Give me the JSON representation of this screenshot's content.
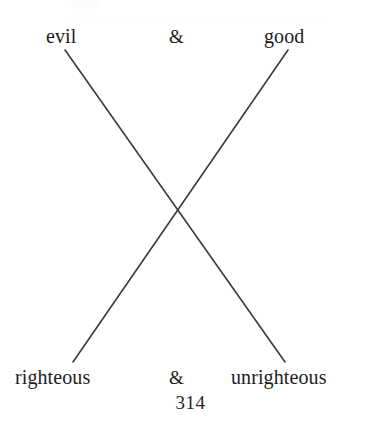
{
  "page": {
    "background_color": "#ffffff",
    "text_color": "#1d1d1d",
    "width": 381,
    "height": 436
  },
  "diagram": {
    "type": "chiasmus-cross",
    "line_color": "#3a3a3a",
    "line_width": 1.6,
    "crossing_point": {
      "x": 178,
      "y": 207
    },
    "lines": [
      {
        "name": "evil-to-unrighteous",
        "x1": 65,
        "y1": 50,
        "x2": 285,
        "y2": 362
      },
      {
        "name": "good-to-righteous",
        "x1": 288,
        "y1": 50,
        "x2": 73,
        "y2": 362
      }
    ]
  },
  "top_row": {
    "left_label": "evil",
    "conjunction": "&",
    "right_label": "good"
  },
  "bottom_row": {
    "left_label": "righteous",
    "conjunction": "&",
    "right_label": "unrighteous"
  },
  "footer": {
    "page_number": "314"
  }
}
